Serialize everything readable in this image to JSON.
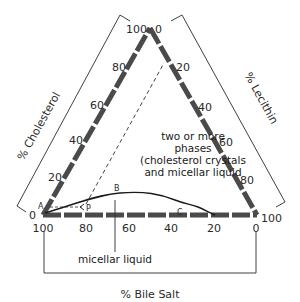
{
  "diagram": {
    "type": "ternary-phase-diagram",
    "axes": {
      "cholesterol": {
        "title": "% Cholesterol",
        "ticks": [
          "0",
          "20",
          "40",
          "60",
          "80",
          "100"
        ]
      },
      "lecithin": {
        "title": "% Lecithin",
        "ticks": [
          "0",
          "20",
          "40",
          "60",
          "80",
          "100"
        ]
      },
      "bile_salt": {
        "title": "% Bile Salt",
        "ticks": [
          "100",
          "80",
          "60",
          "40",
          "20",
          "0"
        ]
      }
    },
    "regions": {
      "two_phase_line1": "two or more",
      "two_phase_line2": "phases",
      "two_phase_line3": "(cholesterol crystals",
      "two_phase_line4": "and micellar liquid",
      "micellar": "micellar liquid"
    },
    "points": {
      "a": "A",
      "b": "B",
      "c": "C",
      "p": "P"
    },
    "colors": {
      "axis": "#4a4a4a",
      "text": "#2a2a2a",
      "background": "#ffffff"
    }
  }
}
